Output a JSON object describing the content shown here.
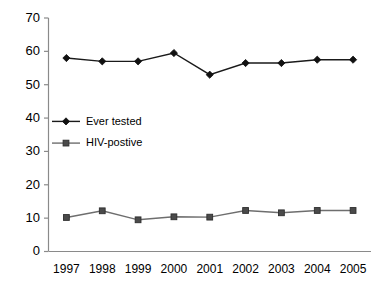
{
  "chart_data": {
    "type": "line",
    "title": "",
    "xlabel": "",
    "ylabel": "",
    "categories": [
      "1997",
      "1998",
      "1999",
      "2000",
      "2001",
      "2002",
      "2003",
      "2004",
      "2005"
    ],
    "series": [
      {
        "name": "Ever tested",
        "marker": "diamond",
        "color": "#111111",
        "values": [
          58,
          57,
          57,
          59.5,
          53,
          56.5,
          56.5,
          57.5,
          57.5
        ]
      },
      {
        "name": "HIV-postive",
        "marker": "square",
        "color": "#4a4a4a",
        "values": [
          10.2,
          12.2,
          9.5,
          10.4,
          10.3,
          12.3,
          11.6,
          12.3,
          12.3
        ]
      }
    ],
    "ylim": [
      0,
      70
    ],
    "ytick_labels": [
      "0",
      "10",
      "20",
      "30",
      "40",
      "50",
      "60",
      "70"
    ],
    "ytick_values": [
      0,
      10,
      20,
      30,
      40,
      50,
      60,
      70
    ],
    "grid": false,
    "legend_position": "inside-left-middle"
  },
  "legend": {
    "items": [
      {
        "label": "Ever tested"
      },
      {
        "label": "HIV-postive"
      }
    ]
  }
}
